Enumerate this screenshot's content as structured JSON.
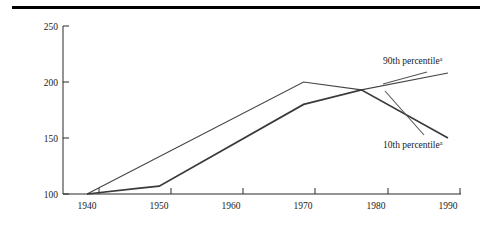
{
  "figure": {
    "top_rule": "horizontal-rule"
  },
  "chart_data": {
    "type": "line",
    "title": "",
    "subtitle": "",
    "xlabel": "",
    "ylabel": "",
    "xlim": [
      1940,
      1995
    ],
    "ylim": [
      100,
      250
    ],
    "yticks": [
      100,
      150,
      200,
      250
    ],
    "ytick_labels": [
      "100",
      "150",
      "200",
      "250"
    ],
    "xticks": [
      1940,
      1950,
      1960,
      1970,
      1980,
      1990
    ],
    "xtick_labels": [
      "1940",
      "1950",
      "1960",
      "1970",
      "1980",
      "1990"
    ],
    "minor_xticks": [
      1945,
      1955,
      1965,
      1975,
      1985,
      1995
    ],
    "grid": false,
    "legend_position": "inline-annotation",
    "series": [
      {
        "name": "90th percentile",
        "footnote_marker": "a",
        "label": "90th percentile",
        "x": [
          1940,
          1970,
          1978,
          1990
        ],
        "values": [
          100,
          200,
          193,
          208
        ],
        "line_weight": "thin",
        "color": "#444444"
      },
      {
        "name": "10th percentile",
        "footnote_marker": "a",
        "label": "10th percentile",
        "x": [
          1940,
          1947,
          1950,
          1970,
          1978,
          1990
        ],
        "values": [
          100,
          105,
          107,
          180,
          193,
          150
        ],
        "line_weight": "thick",
        "color": "#3a3a3a"
      }
    ],
    "annotations": [
      {
        "text": "90th percentile",
        "marker": "a",
        "x": 1981,
        "y": 222
      },
      {
        "text": "10th percentile",
        "marker": "a",
        "x": 1981,
        "y": 139
      }
    ]
  }
}
